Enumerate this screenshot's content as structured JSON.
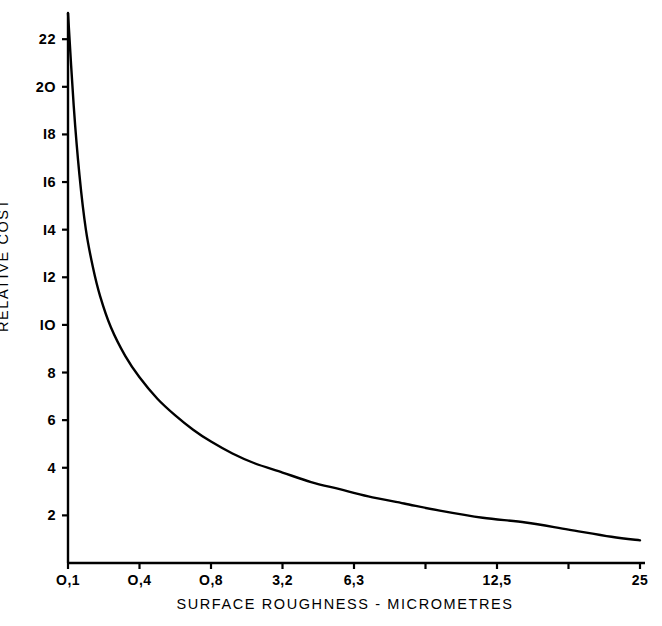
{
  "chart_data": {
    "type": "line",
    "title": "",
    "xlabel": "SURFACE ROUGHNESS - MICROMETRES",
    "ylabel": "RELATIVE COST",
    "grid": false,
    "legend": false,
    "x_tick_labels": [
      "O,1",
      "O,4",
      "O,8",
      "3,2",
      "6,3",
      "12,5",
      "25"
    ],
    "x_tick_positions": [
      0,
      1,
      2,
      3,
      4,
      6,
      8
    ],
    "x_axis_type": "ordinal-roughness-grades",
    "xlim": [
      0,
      8
    ],
    "y_tick_labels": [
      "2",
      "4",
      "6",
      "8",
      "IO",
      "I2",
      "I4",
      "I6",
      "I8",
      "2O",
      "22"
    ],
    "y_tick_values": [
      2,
      4,
      6,
      8,
      10,
      12,
      14,
      16,
      18,
      20,
      22
    ],
    "ylim": [
      0,
      23.1
    ],
    "series": [
      {
        "name": "Relative cost vs surface roughness",
        "x": [
          0.0,
          0.08,
          0.16,
          0.25,
          0.35,
          0.45,
          0.6,
          0.8,
          1.0,
          1.25,
          1.5,
          1.75,
          2.0,
          2.3,
          2.6,
          3.0,
          3.4,
          3.8,
          4.2,
          4.7,
          5.2,
          5.8,
          6.4,
          7.0,
          7.6,
          8.0
        ],
        "y": [
          23.1,
          19.2,
          16.3,
          14.0,
          12.4,
          11.2,
          9.9,
          8.7,
          7.8,
          6.9,
          6.2,
          5.6,
          5.1,
          4.6,
          4.2,
          3.8,
          3.4,
          3.1,
          2.8,
          2.5,
          2.2,
          1.9,
          1.7,
          1.4,
          1.1,
          0.95
        ]
      }
    ],
    "colors": {
      "curve": "#000000",
      "axis": "#000000",
      "background": "#ffffff",
      "text": "#000000"
    }
  },
  "figure": {
    "minus_sign": "-"
  }
}
